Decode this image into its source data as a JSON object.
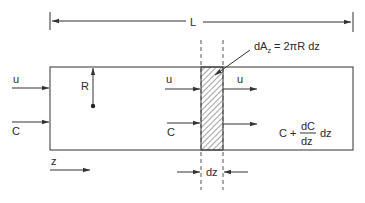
{
  "diagram": {
    "type": "cylindrical-reactor-differential-element",
    "colors": {
      "line": "#333333",
      "text": "#2a2a2a",
      "background": "#ffffff"
    },
    "length_dimension": {
      "label": "L"
    },
    "inlet": {
      "velocity_label": "u",
      "concentration_label": "C"
    },
    "radius": {
      "label": "R"
    },
    "element": {
      "area_label_prefix": "dA",
      "area_label_subscript": "z",
      "area_label_suffix": " = 2πR  dz",
      "thickness_label": "dz"
    },
    "element_inflow": {
      "velocity_label": "u",
      "concentration_label": "C"
    },
    "element_outflow": {
      "velocity_label": "u",
      "concentration_prefix": "C +",
      "derivative_numerator": "dC",
      "derivative_denominator": "dz",
      "concentration_suffix": "dz"
    },
    "axis": {
      "label": "z"
    }
  }
}
